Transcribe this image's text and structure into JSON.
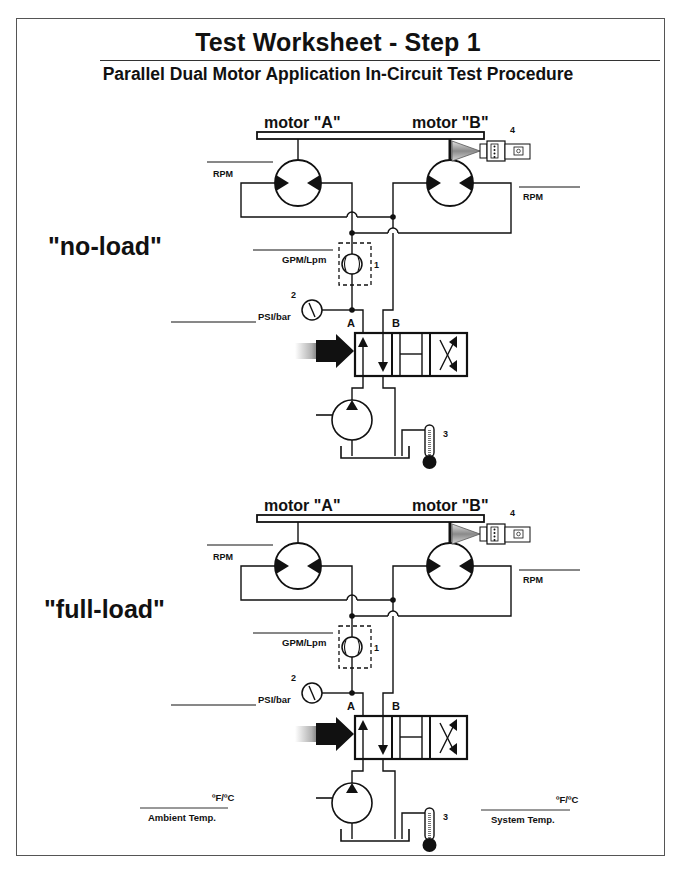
{
  "header": {
    "title": "Test  Worksheet - Step 1",
    "subtitle": "Parallel Dual Motor Application In-Circuit Test Procedure"
  },
  "sections": [
    {
      "id": "no-load",
      "label": "\"no-load\"",
      "motor_a_label": "motor \"A\"",
      "motor_b_label": "motor \"B\"",
      "motor_a_rpm_label": "RPM",
      "motor_b_rpm_label": "RPM",
      "flow_label": "GPM/Lpm",
      "pressure_label": "PSI/bar",
      "port_a": "A",
      "port_b": "B",
      "callouts": {
        "flow_meter": "1",
        "pressure_gauge": "2",
        "thermometer": "3",
        "tachometer": "4"
      }
    },
    {
      "id": "full-load",
      "label": "\"full-load\"",
      "motor_a_label": "motor \"A\"",
      "motor_b_label": "motor \"B\"",
      "motor_a_rpm_label": "RPM",
      "motor_b_rpm_label": "RPM",
      "flow_label": "GPM/Lpm",
      "pressure_label": "PSI/bar",
      "port_a": "A",
      "port_b": "B",
      "callouts": {
        "flow_meter": "1",
        "pressure_gauge": "2",
        "thermometer": "3",
        "tachometer": "4"
      }
    }
  ],
  "temperatures": {
    "ambient": {
      "unit": "ºF/ºC",
      "label": "Ambient Temp."
    },
    "system": {
      "unit": "ºF/ºC",
      "label": "System Temp."
    }
  },
  "colors": {
    "ink": "#111111",
    "frame": "#555555",
    "tach_cone": "#9a9a9a"
  }
}
